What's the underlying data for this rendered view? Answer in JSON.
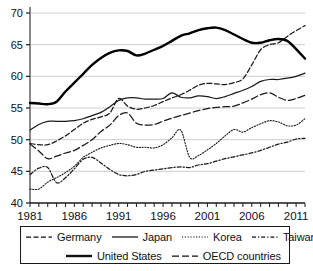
{
  "chart_data": {
    "type": "line",
    "title": "",
    "xlabel": "",
    "ylabel": "",
    "xlim": [
      1981,
      2012
    ],
    "ylim": [
      40,
      70
    ],
    "yticks": [
      40,
      45,
      50,
      55,
      60,
      65,
      70
    ],
    "xticks": [
      1981,
      1986,
      1991,
      1996,
      2001,
      2006,
      2011
    ],
    "xtick_labels": [
      "1981",
      "1986",
      "1991",
      "1996",
      "2001",
      "2006",
      "2011"
    ],
    "ytick_labels": [
      "40",
      "45",
      "50",
      "55",
      "60",
      "65",
      "70"
    ],
    "grid": "horizontal",
    "legend_position": "below",
    "x": [
      1981,
      1982,
      1983,
      1984,
      1985,
      1986,
      1987,
      1988,
      1989,
      1990,
      1991,
      1992,
      1993,
      1994,
      1995,
      1996,
      1997,
      1998,
      1999,
      2000,
      2001,
      2002,
      2003,
      2004,
      2005,
      2006,
      2007,
      2008,
      2009,
      2010,
      2011,
      2012
    ],
    "series": [
      {
        "name": "Germany",
        "style": "dashed",
        "color": "#1a1a1a",
        "values": [
          49.4,
          49.2,
          49.2,
          49.8,
          50.6,
          51.6,
          52.6,
          53.2,
          53.6,
          54.2,
          56.5,
          55.3,
          54.8,
          55.0,
          55.4,
          56.0,
          56.6,
          57.1,
          57.8,
          58.6,
          58.9,
          58.8,
          58.7,
          59.0,
          59.6,
          61.8,
          64.2,
          65.0,
          65.3,
          66.3,
          67.2,
          68.0
        ]
      },
      {
        "name": "Japan",
        "style": "solid",
        "color": "#1a1a1a",
        "values": [
          51.5,
          52.4,
          52.9,
          52.9,
          52.9,
          53.0,
          53.3,
          53.8,
          54.3,
          55.2,
          56.2,
          56.6,
          56.6,
          56.4,
          56.4,
          56.5,
          57.4,
          56.7,
          56.6,
          56.9,
          56.8,
          56.5,
          56.8,
          57.3,
          57.8,
          58.4,
          59.2,
          59.5,
          59.5,
          59.7,
          60.0,
          60.5
        ]
      },
      {
        "name": "Korea",
        "style": "dotted",
        "color": "#1a1a1a",
        "values": [
          42.2,
          42.2,
          43.3,
          44.0,
          44.8,
          45.8,
          47.2,
          48.0,
          48.7,
          49.1,
          49.4,
          49.2,
          48.8,
          48.8,
          48.7,
          49.2,
          50.3,
          51.5,
          47.2,
          47.5,
          48.4,
          49.4,
          50.6,
          51.6,
          51.2,
          51.9,
          52.5,
          53.0,
          52.8,
          52.2,
          52.3,
          53.3
        ]
      },
      {
        "name": "Taiwan",
        "style": "dashdot",
        "color": "#1a1a1a",
        "values": [
          44.5,
          45.5,
          45.6,
          43.2,
          44.0,
          45.4,
          46.9,
          47.2,
          46.3,
          45.3,
          44.5,
          44.3,
          44.5,
          45.0,
          45.2,
          45.4,
          45.6,
          45.7,
          45.6,
          46.0,
          46.2,
          46.6,
          47.0,
          47.3,
          47.6,
          47.9,
          48.3,
          48.8,
          49.3,
          49.6,
          50.1,
          50.2
        ]
      },
      {
        "name": "United States",
        "style": "solid-thick",
        "color": "#000000",
        "values": [
          55.8,
          55.7,
          55.6,
          56.0,
          57.6,
          59.0,
          60.4,
          61.8,
          62.9,
          63.7,
          64.1,
          64.0,
          63.3,
          63.6,
          64.2,
          64.8,
          65.6,
          66.4,
          66.8,
          67.3,
          67.6,
          67.7,
          67.3,
          66.6,
          65.9,
          65.3,
          65.3,
          65.7,
          65.9,
          65.6,
          64.3,
          62.8
        ]
      },
      {
        "name": "OECD countries",
        "style": "longdash",
        "color": "#1a1a1a",
        "values": [
          49.3,
          48.2,
          47.0,
          47.4,
          47.9,
          48.3,
          49.1,
          50.0,
          51.3,
          52.3,
          53.8,
          54.2,
          52.6,
          52.3,
          52.4,
          52.9,
          53.4,
          53.8,
          54.2,
          54.6,
          54.9,
          55.1,
          55.2,
          55.3,
          55.8,
          56.4,
          57.1,
          57.4,
          56.7,
          56.2,
          56.5,
          57.0
        ]
      }
    ]
  },
  "legend": {
    "rows": [
      [
        {
          "label": "Germany",
          "style": "dashed"
        },
        {
          "label": "Japan",
          "style": "solid"
        },
        {
          "label": "Korea",
          "style": "dotted"
        },
        {
          "label": "Taiwan",
          "style": "dashdot"
        }
      ],
      [
        {
          "label": "United States",
          "style": "solid-thick"
        },
        {
          "label": "OECD countries",
          "style": "longdash"
        }
      ]
    ]
  }
}
